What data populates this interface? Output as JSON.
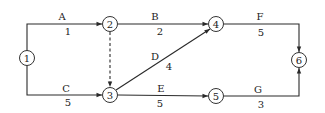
{
  "diagram": {
    "type": "activity-on-arrow network",
    "nodes": [
      {
        "id": "1",
        "label": "1",
        "x": 27,
        "y": 58
      },
      {
        "id": "2",
        "label": "2",
        "x": 110,
        "y": 24
      },
      {
        "id": "3",
        "label": "3",
        "x": 110,
        "y": 95
      },
      {
        "id": "4",
        "label": "4",
        "x": 216,
        "y": 24
      },
      {
        "id": "5",
        "label": "5",
        "x": 216,
        "y": 96
      },
      {
        "id": "6",
        "label": "6",
        "x": 299,
        "y": 60
      }
    ],
    "activities": [
      {
        "name": "A",
        "duration": "1",
        "from": "1",
        "to": "2"
      },
      {
        "name": "B",
        "duration": "2",
        "from": "2",
        "to": "4"
      },
      {
        "name": "C",
        "duration": "5",
        "from": "1",
        "to": "3"
      },
      {
        "name": "D",
        "duration": "4",
        "from": "3",
        "to": "4"
      },
      {
        "name": "E",
        "duration": "5",
        "from": "3",
        "to": "5"
      },
      {
        "name": "F",
        "duration": "5",
        "from": "4",
        "to": "6"
      },
      {
        "name": "G",
        "duration": "3",
        "from": "5",
        "to": "6"
      },
      {
        "name": "",
        "duration": "",
        "from": "2",
        "to": "3",
        "dummy": true
      }
    ]
  }
}
